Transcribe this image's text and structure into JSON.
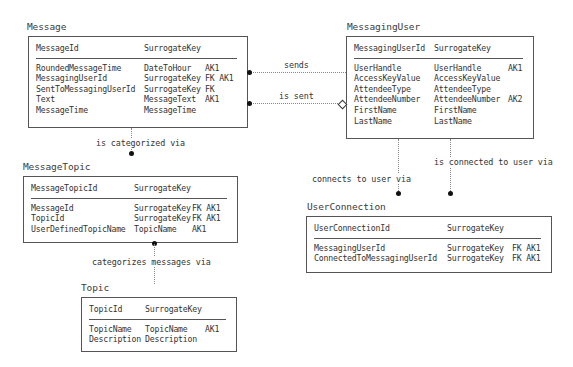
{
  "entities": {
    "message": {
      "title": "Message",
      "pk": {
        "name": "MessageId",
        "type": "SurrogateKey",
        "keys": ""
      },
      "attrs": [
        {
          "name": "RoundedMessageTime",
          "type": "DateToHour",
          "keys": "AK1"
        },
        {
          "name": "MessagingUserId",
          "type": "SurrogateKey",
          "keys": "FK AK1"
        },
        {
          "name": "SentToMessagingUserId",
          "type": "SurrogateKey",
          "keys": "FK"
        },
        {
          "name": "Text",
          "type": "MessageText",
          "keys": "AK1"
        },
        {
          "name": "MessageTime",
          "type": "MessageTime",
          "keys": ""
        }
      ]
    },
    "messaging_user": {
      "title": "MessagingUser",
      "pk": {
        "name": "MessagingUserId",
        "type": "SurrogateKey",
        "keys": ""
      },
      "attrs": [
        {
          "name": "UserHandle",
          "type": "UserHandle",
          "keys": "AK1"
        },
        {
          "name": "AccessKeyValue",
          "type": "AccessKeyValue",
          "keys": ""
        },
        {
          "name": "AttendeeType",
          "type": "AttendeeType",
          "keys": ""
        },
        {
          "name": "AttendeeNumber",
          "type": "AttendeeNumber",
          "keys": "AK2"
        },
        {
          "name": "FirstName",
          "type": "FirstName",
          "keys": ""
        },
        {
          "name": "LastName",
          "type": "LastName",
          "keys": ""
        }
      ]
    },
    "message_topic": {
      "title": "MessageTopic",
      "pk": {
        "name": "MessageTopicId",
        "type": "SurrogateKey",
        "keys": ""
      },
      "attrs": [
        {
          "name": "MessageId",
          "type": "SurrogateKey",
          "keys": "FK AK1"
        },
        {
          "name": "TopicId",
          "type": "SurrogateKey",
          "keys": "FK AK1"
        },
        {
          "name": "UserDefinedTopicName",
          "type": "TopicName",
          "keys": "AK1"
        }
      ]
    },
    "topic": {
      "title": "Topic",
      "pk": {
        "name": "TopicId",
        "type": "SurrogateKey",
        "keys": ""
      },
      "attrs": [
        {
          "name": "TopicName",
          "type": "TopicName",
          "keys": "AK1"
        },
        {
          "name": "Description",
          "type": "Description",
          "keys": ""
        }
      ]
    },
    "user_connection": {
      "title": "UserConnection",
      "pk": {
        "name": "UserConnectionId",
        "type": "SurrogateKey",
        "keys": ""
      },
      "attrs": [
        {
          "name": "MessagingUserId",
          "type": "SurrogateKey",
          "keys": "FK AK1"
        },
        {
          "name": "ConnectedToMessagingUserId",
          "type": "SurrogateKey",
          "keys": "FK AK1"
        }
      ]
    }
  },
  "relationships": {
    "sends": "sends",
    "is_sent": "is sent",
    "is_categorized_via": "is categorized via",
    "categorizes_messages_via": "categorizes messages via",
    "connects_to_user_via": "connects to user via",
    "is_connected_to_user_via": "is connected to user via"
  }
}
